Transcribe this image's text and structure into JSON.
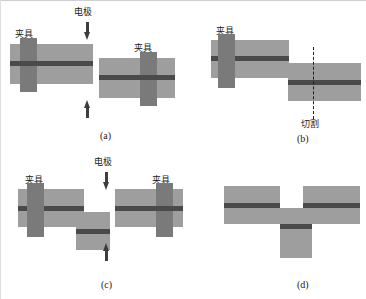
{
  "figure": {
    "colors": {
      "plate": "#9e9e9e",
      "clamp": "#7a7a7a",
      "seam": "#4a4a4a",
      "arrow": "#3d3d3d",
      "cut_line": "#1f1f1f",
      "background": "#ffffff"
    }
  },
  "labels": {
    "clamp": "夹具",
    "electrode": "电极",
    "cutting": "切割"
  },
  "panels": [
    {
      "id": "a",
      "caption": "(a)",
      "description": "Two clamped sheets positioned between upper and lower electrodes before welding",
      "clamp_labels": [
        "夹具",
        "夹具"
      ],
      "electrode_label": "电极",
      "electrode_arrows": [
        "down",
        "up"
      ]
    },
    {
      "id": "b",
      "caption": "(b)",
      "description": "Welded lap joint held by one clamp, with dashed line marking the cutting location",
      "clamp_labels": [
        "夹具"
      ],
      "cut_label": "切割",
      "cut_line": "dashed-vertical"
    },
    {
      "id": "c",
      "caption": "(c)",
      "description": "Stepped specimen and second sheet re-clamped between electrodes for the next weld",
      "clamp_labels": [
        "夹具",
        "夹具"
      ],
      "electrode_label": "电极",
      "electrode_arrows": [
        "down",
        "up"
      ]
    },
    {
      "id": "d",
      "caption": "(d)",
      "description": "Final T-shaped / cross-tension welded assembly",
      "clamp_labels": [],
      "electrode_arrows": []
    }
  ]
}
